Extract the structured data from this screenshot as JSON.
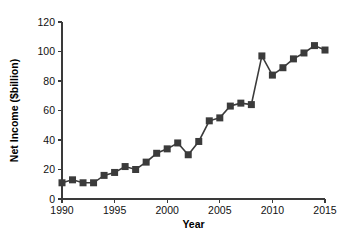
{
  "chart_data": {
    "type": "line",
    "title": "",
    "subtitle": "",
    "xlabel": "Year",
    "ylabel": "Net Income ($billion)",
    "xlim": [
      1990,
      2015
    ],
    "ylim": [
      0,
      120
    ],
    "xticks": [
      1990,
      1995,
      2000,
      2005,
      2010,
      2015
    ],
    "xtick_labels": [
      "1990",
      "1995",
      "2000",
      "2005",
      "2010",
      "2015"
    ],
    "yticks": [
      0,
      20,
      40,
      60,
      80,
      100,
      120
    ],
    "ytick_labels": [
      "0",
      "20",
      "40",
      "60",
      "80",
      "100",
      "120"
    ],
    "grid": false,
    "legend": false,
    "legend_position": "none",
    "marker": "square",
    "line_color": "#3b3b3b",
    "marker_color": "#3b3b3b",
    "background_color": "#ffffff",
    "x": [
      1990,
      1991,
      1992,
      1993,
      1994,
      1995,
      1996,
      1997,
      1998,
      1999,
      2000,
      2001,
      2002,
      2003,
      2004,
      2005,
      2006,
      2007,
      2008,
      2009,
      2010,
      2011,
      2012,
      2013,
      2014,
      2015
    ],
    "values": [
      11,
      13,
      11,
      11,
      16,
      18,
      22,
      20,
      25,
      31,
      34,
      38,
      30,
      39,
      53,
      55,
      63,
      65,
      64,
      97,
      84,
      89,
      95,
      99,
      104,
      101
    ],
    "series": [
      {
        "name": "Net Income",
        "values": [
          11,
          13,
          11,
          11,
          16,
          18,
          22,
          20,
          25,
          31,
          34,
          38,
          30,
          39,
          53,
          55,
          63,
          65,
          64,
          97,
          84,
          89,
          95,
          99,
          104,
          101
        ]
      }
    ],
    "annotations": []
  },
  "plot_geometry": {
    "left": 62,
    "right": 325,
    "top": 22,
    "bottom": 199,
    "tick_length": 4,
    "marker_size": 7
  }
}
